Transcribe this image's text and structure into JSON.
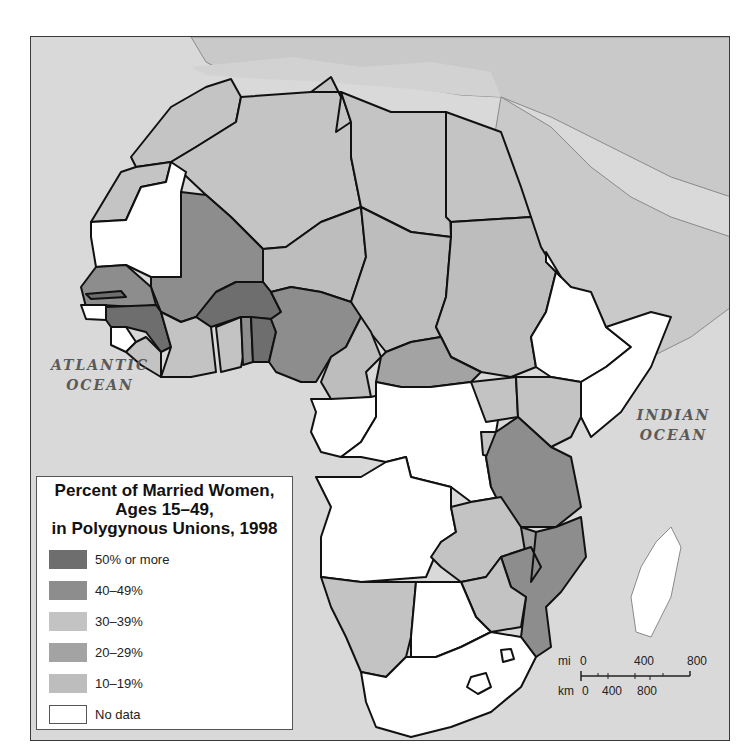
{
  "map": {
    "title_lines": [
      "Percent of Married Women,",
      "Ages 15–49,",
      "in Polygynous Unions, 1998"
    ],
    "ocean_labels": {
      "atlantic": [
        "ATLANTIC",
        "OCEAN"
      ],
      "indian": [
        "INDIAN",
        "OCEAN"
      ]
    },
    "colors": {
      "ocean": "#d9d9d9",
      "other_land": "#c9c9c9",
      "border": "#111111"
    },
    "legend": [
      {
        "key": "c50",
        "label": "50% or more",
        "color": "#6e6e6e"
      },
      {
        "key": "c40",
        "label": "40–49%",
        "color": "#8d8d8d"
      },
      {
        "key": "c30",
        "label": "30–39%",
        "color": "#c3c3c3"
      },
      {
        "key": "c20",
        "label": "20–29%",
        "color": "#a3a3a3"
      },
      {
        "key": "c10",
        "label": "10–19%",
        "color": "#bdbdbd"
      },
      {
        "key": "nodata",
        "label": "No data",
        "color": "#ffffff"
      }
    ],
    "scale": {
      "mi_label": "mi",
      "km_label": "km",
      "mi_ticks": [
        "0",
        "400",
        "800"
      ],
      "km_ticks": [
        "0",
        "400",
        "800"
      ]
    }
  }
}
